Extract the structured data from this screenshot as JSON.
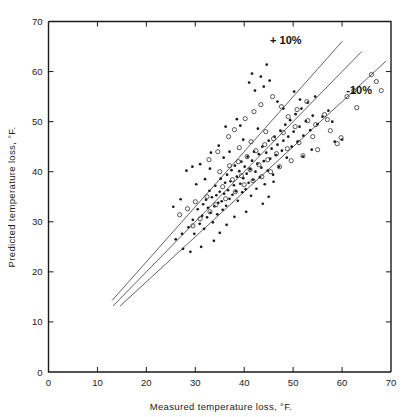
{
  "chart_data": {
    "type": "scatter",
    "title": "",
    "xlabel": "Measured temperature loss, °F.",
    "ylabel": "Predicted temperature loss, °F.",
    "xlim": [
      0,
      70
    ],
    "ylim": [
      0,
      70
    ],
    "xticks": [
      0,
      10,
      20,
      30,
      40,
      50,
      60,
      70
    ],
    "yticks": [
      0,
      10,
      20,
      30,
      40,
      50,
      60,
      70
    ],
    "xtick_labels": [
      "0",
      "10",
      "20",
      "30",
      "40",
      "50",
      "60",
      "70"
    ],
    "ytick_labels": [
      "0",
      "10",
      "20",
      "30",
      "40",
      "50",
      "60",
      "70"
    ],
    "grid": false,
    "legend": "none",
    "annotations": [
      {
        "text": "+ 10%",
        "x": 48.5,
        "y": 65.5
      },
      {
        "text": "-10%",
        "x": 63.5,
        "y": 55.5
      }
    ],
    "reference_lines": [
      {
        "name": "plus-10-percent",
        "slope": 1.1,
        "intercept": 0,
        "x_start": 13.0,
        "x_end": 60.0
      },
      {
        "name": "identity",
        "slope": 1.0,
        "intercept": 0,
        "x_start": 13.2,
        "x_end": 64.0
      },
      {
        "name": "minus-10-percent",
        "slope": 0.9,
        "intercept": 0,
        "x_start": 14.6,
        "x_end": 69.0
      }
    ],
    "series": [
      {
        "name": "filled-markers",
        "marker": "filled-circle",
        "points": [
          [
            26.0,
            26.5
          ],
          [
            27.3,
            27.6
          ],
          [
            27.5,
            24.6
          ],
          [
            28.6,
            28.9
          ],
          [
            29.5,
            30.4
          ],
          [
            29.8,
            27.6
          ],
          [
            30.5,
            32.5
          ],
          [
            30.9,
            29.6
          ],
          [
            31.4,
            31.2
          ],
          [
            31.6,
            33.5
          ],
          [
            31.8,
            28.6
          ],
          [
            32.2,
            34.4
          ],
          [
            32.4,
            30.9
          ],
          [
            32.6,
            32.8
          ],
          [
            32.9,
            36.2
          ],
          [
            33.1,
            31.8
          ],
          [
            33.4,
            34.9
          ],
          [
            33.6,
            29.9
          ],
          [
            33.9,
            33.1
          ],
          [
            34.1,
            37.2
          ],
          [
            34.3,
            35.3
          ],
          [
            34.5,
            31.5
          ],
          [
            34.7,
            33.8
          ],
          [
            35.0,
            36.0
          ],
          [
            35.2,
            38.6
          ],
          [
            35.4,
            34.1
          ],
          [
            35.6,
            32.4
          ],
          [
            35.9,
            35.6
          ],
          [
            36.1,
            37.8
          ],
          [
            36.3,
            33.2
          ],
          [
            36.5,
            39.4
          ],
          [
            36.7,
            36.3
          ],
          [
            37.0,
            34.6
          ],
          [
            37.2,
            38.1
          ],
          [
            37.4,
            40.3
          ],
          [
            37.6,
            35.4
          ],
          [
            37.9,
            37.3
          ],
          [
            38.1,
            41.2
          ],
          [
            38.3,
            36.1
          ],
          [
            38.5,
            39.0
          ],
          [
            38.7,
            34.2
          ],
          [
            39.0,
            40.1
          ],
          [
            39.2,
            37.6
          ],
          [
            39.4,
            42.0
          ],
          [
            39.6,
            35.9
          ],
          [
            39.8,
            38.7
          ],
          [
            40.1,
            41.0
          ],
          [
            40.3,
            36.5
          ],
          [
            40.5,
            39.6
          ],
          [
            40.7,
            43.0
          ],
          [
            40.9,
            37.8
          ],
          [
            41.2,
            40.5
          ],
          [
            41.4,
            35.2
          ],
          [
            41.6,
            42.2
          ],
          [
            41.8,
            38.4
          ],
          [
            42.0,
            44.0
          ],
          [
            42.3,
            40.0
          ],
          [
            42.5,
            36.6
          ],
          [
            42.7,
            41.6
          ],
          [
            43.0,
            43.5
          ],
          [
            43.2,
            38.9
          ],
          [
            43.5,
            40.8
          ],
          [
            43.7,
            45.0
          ],
          [
            44.0,
            42.1
          ],
          [
            44.2,
            37.5
          ],
          [
            44.5,
            43.8
          ],
          [
            44.8,
            40.2
          ],
          [
            45.0,
            46.2
          ],
          [
            45.3,
            42.6
          ],
          [
            45.6,
            44.6
          ],
          [
            45.9,
            39.4
          ],
          [
            46.2,
            47.0
          ],
          [
            46.5,
            43.3
          ],
          [
            46.8,
            45.4
          ],
          [
            47.1,
            41.0
          ],
          [
            47.4,
            48.2
          ],
          [
            47.7,
            44.2
          ],
          [
            48.0,
            46.2
          ],
          [
            48.4,
            49.4
          ],
          [
            48.7,
            42.8
          ],
          [
            49.0,
            47.0
          ],
          [
            49.4,
            50.3
          ],
          [
            49.7,
            45.0
          ],
          [
            50.1,
            48.0
          ],
          [
            50.5,
            51.5
          ],
          [
            50.9,
            46.0
          ],
          [
            51.3,
            49.0
          ],
          [
            51.7,
            52.6
          ],
          [
            52.1,
            47.2
          ],
          [
            52.6,
            50.1
          ],
          [
            53.0,
            53.8
          ],
          [
            53.5,
            48.3
          ],
          [
            54.0,
            51.2
          ],
          [
            54.5,
            55.0
          ],
          [
            55.0,
            49.5
          ],
          [
            41.0,
            57.8
          ],
          [
            41.6,
            59.6
          ],
          [
            42.2,
            56.2
          ],
          [
            43.4,
            59.0
          ],
          [
            44.0,
            57.0
          ],
          [
            44.6,
            61.4
          ],
          [
            45.2,
            58.2
          ],
          [
            38.5,
            50.5
          ],
          [
            39.2,
            49.2
          ],
          [
            36.2,
            49.0
          ],
          [
            34.8,
            45.2
          ],
          [
            33.2,
            43.8
          ],
          [
            31.0,
            41.5
          ],
          [
            29.4,
            41.0
          ],
          [
            28.2,
            40.2
          ],
          [
            46.8,
            54.0
          ],
          [
            48.0,
            52.6
          ],
          [
            50.2,
            56.0
          ],
          [
            51.4,
            54.4
          ],
          [
            56.0,
            51.0
          ],
          [
            57.2,
            52.2
          ],
          [
            58.0,
            50.0
          ],
          [
            33.0,
            40.6
          ],
          [
            35.8,
            42.8
          ],
          [
            37.0,
            44.0
          ],
          [
            39.8,
            46.4
          ],
          [
            42.8,
            48.6
          ],
          [
            43.8,
            33.6
          ],
          [
            45.0,
            35.0
          ],
          [
            46.0,
            38.0
          ],
          [
            40.4,
            32.0
          ],
          [
            38.0,
            31.0
          ],
          [
            36.4,
            29.4
          ],
          [
            30.2,
            37.5
          ],
          [
            32.0,
            38.5
          ],
          [
            58.5,
            46.0
          ],
          [
            60.0,
            46.4
          ],
          [
            52.0,
            43.0
          ],
          [
            53.8,
            44.4
          ],
          [
            35.0,
            27.8
          ],
          [
            33.8,
            26.2
          ],
          [
            31.2,
            25.0
          ],
          [
            29.0,
            24.0
          ],
          [
            25.5,
            33.0
          ],
          [
            27.0,
            34.5
          ]
        ]
      },
      {
        "name": "open-markers",
        "marker": "open-circle",
        "points": [
          [
            29.5,
            29.2
          ],
          [
            31.0,
            30.6
          ],
          [
            32.4,
            35.0
          ],
          [
            33.0,
            32.0
          ],
          [
            34.2,
            33.4
          ],
          [
            35.0,
            40.0
          ],
          [
            35.6,
            37.0
          ],
          [
            36.2,
            34.6
          ],
          [
            37.0,
            41.2
          ],
          [
            37.6,
            38.4
          ],
          [
            38.2,
            36.0
          ],
          [
            38.8,
            42.0
          ],
          [
            39.4,
            39.2
          ],
          [
            40.0,
            37.4
          ],
          [
            40.6,
            43.0
          ],
          [
            41.2,
            40.4
          ],
          [
            41.8,
            38.2
          ],
          [
            42.4,
            44.2
          ],
          [
            43.0,
            41.4
          ],
          [
            43.6,
            39.0
          ],
          [
            44.2,
            45.4
          ],
          [
            44.8,
            42.4
          ],
          [
            45.4,
            40.0
          ],
          [
            46.0,
            46.6
          ],
          [
            46.6,
            43.6
          ],
          [
            47.2,
            41.0
          ],
          [
            48.0,
            47.8
          ],
          [
            48.8,
            44.6
          ],
          [
            49.6,
            42.2
          ],
          [
            50.4,
            49.0
          ],
          [
            51.2,
            45.8
          ],
          [
            52.0,
            43.2
          ],
          [
            53.0,
            50.2
          ],
          [
            54.0,
            47.0
          ],
          [
            55.0,
            44.4
          ],
          [
            56.4,
            51.4
          ],
          [
            57.6,
            48.2
          ],
          [
            59.0,
            45.6
          ],
          [
            61.0,
            55.0
          ],
          [
            62.4,
            56.2
          ],
          [
            63.0,
            52.8
          ],
          [
            66.0,
            59.4
          ],
          [
            67.0,
            58.0
          ],
          [
            68.0,
            56.2
          ],
          [
            36.8,
            47.0
          ],
          [
            38.0,
            48.4
          ],
          [
            40.2,
            50.6
          ],
          [
            42.0,
            52.0
          ],
          [
            43.4,
            53.4
          ],
          [
            30.0,
            34.0
          ],
          [
            28.4,
            32.6
          ],
          [
            26.8,
            31.4
          ],
          [
            34.6,
            44.0
          ],
          [
            32.8,
            42.4
          ],
          [
            45.8,
            55.0
          ],
          [
            47.6,
            53.0
          ],
          [
            49.0,
            51.0
          ],
          [
            50.8,
            52.4
          ],
          [
            52.8,
            54.0
          ],
          [
            59.8,
            46.8
          ],
          [
            54.6,
            49.4
          ],
          [
            57.0,
            50.4
          ],
          [
            39.0,
            44.8
          ],
          [
            41.4,
            46.0
          ],
          [
            44.4,
            48.0
          ]
        ]
      }
    ]
  },
  "axes": {
    "x_title": "Measured temperature loss, °F.",
    "y_title": "Predicted temperature loss, °F."
  },
  "annotations": {
    "plus_ten": "+ 10%",
    "minus_ten": "-10%"
  },
  "colors": {
    "frame": "#1a1a1a",
    "line": "#3b3b3b",
    "marker_filled": "#1a1a1a",
    "marker_open": "#3a3a3a",
    "background": "#ffffff"
  }
}
